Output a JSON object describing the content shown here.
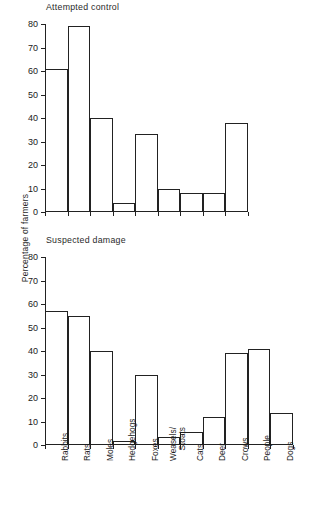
{
  "figure": {
    "ylabel": "Percentage of farmers"
  },
  "chart_data": [
    {
      "type": "bar",
      "title": "Attempted control",
      "xlabel": "",
      "ylabel": "Percentage of farmers",
      "ylim": [
        0,
        80
      ],
      "yticks": [
        0,
        10,
        20,
        30,
        40,
        50,
        60,
        70,
        80
      ],
      "grid": false,
      "legend": "none",
      "categories": [
        "Rabbits",
        "Rats",
        "Moles",
        "Hedgehogs",
        "Foxes",
        "Weasels/Stoats",
        "Cats",
        "Deer",
        "Crows",
        "People",
        "Dogs"
      ],
      "values": [
        61,
        79,
        40,
        4,
        33,
        10,
        8,
        8,
        38,
        0,
        0
      ]
    },
    {
      "type": "bar",
      "title": "Suspected damage",
      "xlabel": "",
      "ylabel": "Percentage of farmers",
      "ylim": [
        0,
        80
      ],
      "yticks": [
        0,
        10,
        20,
        30,
        40,
        50,
        60,
        70,
        80
      ],
      "grid": false,
      "legend": "none",
      "categories": [
        "Rabbits",
        "Rats",
        "Moles",
        "Hedgehogs",
        "Foxes",
        "Weasels/Stoats",
        "Cats",
        "Deer",
        "Crows",
        "People",
        "Dogs"
      ],
      "values": [
        57,
        55,
        40,
        1.5,
        30,
        3.5,
        5.5,
        12,
        39,
        41,
        13.5
      ]
    }
  ],
  "xlabels": [
    {
      "lines": [
        "Rabbits"
      ]
    },
    {
      "lines": [
        "Rats"
      ]
    },
    {
      "lines": [
        "Moles"
      ]
    },
    {
      "lines": [
        "Hedgehogs"
      ]
    },
    {
      "lines": [
        "Foxes"
      ]
    },
    {
      "lines": [
        "Weasels/",
        "Stoats"
      ]
    },
    {
      "lines": [
        "Cats"
      ]
    },
    {
      "lines": [
        "Deer"
      ]
    },
    {
      "lines": [
        "Crows"
      ]
    },
    {
      "lines": [
        "People"
      ]
    },
    {
      "lines": [
        "Dogs"
      ]
    }
  ]
}
